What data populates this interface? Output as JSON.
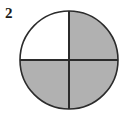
{
  "figure": {
    "label": "2",
    "caption": "",
    "shape_name": "circle",
    "type": "fraction-model",
    "total_parts": 4,
    "shaded_parts": 3,
    "fraction_text": "3/4",
    "background_color": "#ffffff",
    "outline_color": "#2b2b2b",
    "shaded_color": "#b1b1b1",
    "unshaded_color": "#ffffff",
    "label_color": "#1a1a1a",
    "geometry": {
      "center_x": 69,
      "center_y": 60,
      "radius": 49,
      "outline_width": 1.6,
      "divider_width": 2
    },
    "parts": [
      {
        "id": "top-left",
        "name": "quadrant-top-left",
        "shaded": true,
        "start_angle": 180,
        "end_angle": 270
      },
      {
        "id": "top-right",
        "name": "quadrant-top-right",
        "shaded": false,
        "start_angle": 270,
        "end_angle": 360
      },
      {
        "id": "bottom-right",
        "name": "quadrant-bottom-right",
        "shaded": true,
        "start_angle": 0,
        "end_angle": 90
      },
      {
        "id": "bottom-left",
        "name": "quadrant-bottom-left",
        "shaded": true,
        "start_angle": 90,
        "end_angle": 180
      }
    ],
    "dividers": [
      {
        "id": "vertical",
        "name": "divider-vertical",
        "x1": 69,
        "y1": 11,
        "x2": 69,
        "y2": 109
      },
      {
        "id": "horizontal",
        "name": "divider-horizontal",
        "x1": 20,
        "y1": 60,
        "x2": 118,
        "y2": 60
      }
    ]
  }
}
